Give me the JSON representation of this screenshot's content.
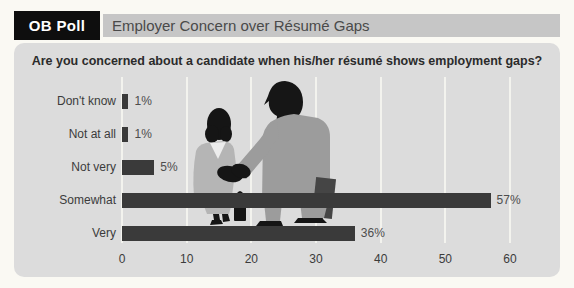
{
  "header": {
    "badge": "OB Poll",
    "title": "Employer Concern over Résumé Gaps"
  },
  "question": "Are you concerned about a candidate when his/her résumé shows employment gaps?",
  "chart_data": {
    "type": "bar",
    "orientation": "horizontal",
    "title": "Employer Concern over Résumé Gaps",
    "categories": [
      "Don't know",
      "Not at all",
      "Not very",
      "Somewhat",
      "Very"
    ],
    "values": [
      1,
      1,
      5,
      57,
      36
    ],
    "value_labels": [
      "1%",
      "1%",
      "5%",
      "57%",
      "36%"
    ],
    "xlim": [
      0,
      60
    ],
    "xticks": [
      0,
      10,
      20,
      30,
      40,
      50,
      60
    ],
    "grid": true,
    "legend": false,
    "bar_color": "#3a3a3a"
  },
  "illustration": {
    "name": "handshake-silhouette",
    "description": "Silhouette of a woman and a businessman shaking hands"
  },
  "colors": {
    "page_background": "#faf9f3",
    "panel_background": "#dcdcdc",
    "header_strip": "#c6c6c6",
    "badge_background": "#0e0e0e",
    "badge_text": "#ffffff",
    "bar": "#3a3a3a",
    "gridline": "#f3f3ee",
    "woman_suit": "#b5b5b5",
    "man_suit": "#9c9c9c",
    "silhouette": "#151515"
  }
}
